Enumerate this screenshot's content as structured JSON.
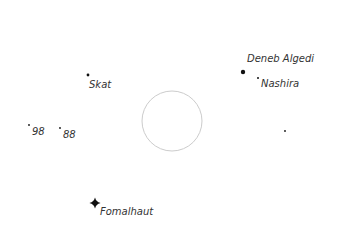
{
  "map": {
    "background": "#ffffff",
    "star_color": "#111111",
    "circle": {
      "cx": 172,
      "cy": 121,
      "r": 30,
      "stroke": "#cccccc"
    },
    "stars": [
      {
        "name": "Deneb Algedi",
        "x": 243,
        "y": 72,
        "size": 2.2,
        "label_x": 247,
        "label_y": 54
      },
      {
        "name": "Nashira",
        "x": 258,
        "y": 78,
        "size": 1.0,
        "label_x": 261,
        "label_y": 79
      },
      {
        "name": "Skat",
        "x": 88,
        "y": 75,
        "size": 1.4,
        "label_x": 89,
        "label_y": 80
      },
      {
        "name": "98",
        "x": 29,
        "y": 125,
        "size": 0.9,
        "label_x": 32,
        "label_y": 127
      },
      {
        "name": "88",
        "x": 60,
        "y": 128,
        "size": 0.9,
        "label_x": 63,
        "label_y": 130
      },
      {
        "name": "Fomalhaut",
        "x": 95,
        "y": 203,
        "size": 3.5,
        "label_x": 100,
        "label_y": 207
      },
      {
        "name": "",
        "x": 285,
        "y": 131,
        "size": 0.9
      }
    ]
  }
}
